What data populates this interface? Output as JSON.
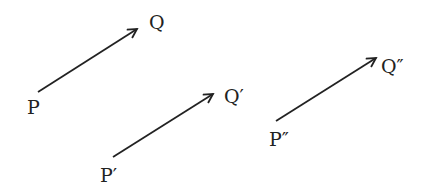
{
  "diagram": {
    "color": "#222222",
    "vectors": [
      {
        "start_label": "P",
        "end_label": "Q",
        "x1": 38,
        "y1": 92,
        "x2": 137,
        "y2": 29
      },
      {
        "start_label": "P′",
        "end_label": "Q′",
        "x1": 113,
        "y1": 157,
        "x2": 213,
        "y2": 94
      },
      {
        "start_label": "P″",
        "end_label": "Q″",
        "x1": 276,
        "y1": 121,
        "x2": 376,
        "y2": 58
      }
    ]
  }
}
